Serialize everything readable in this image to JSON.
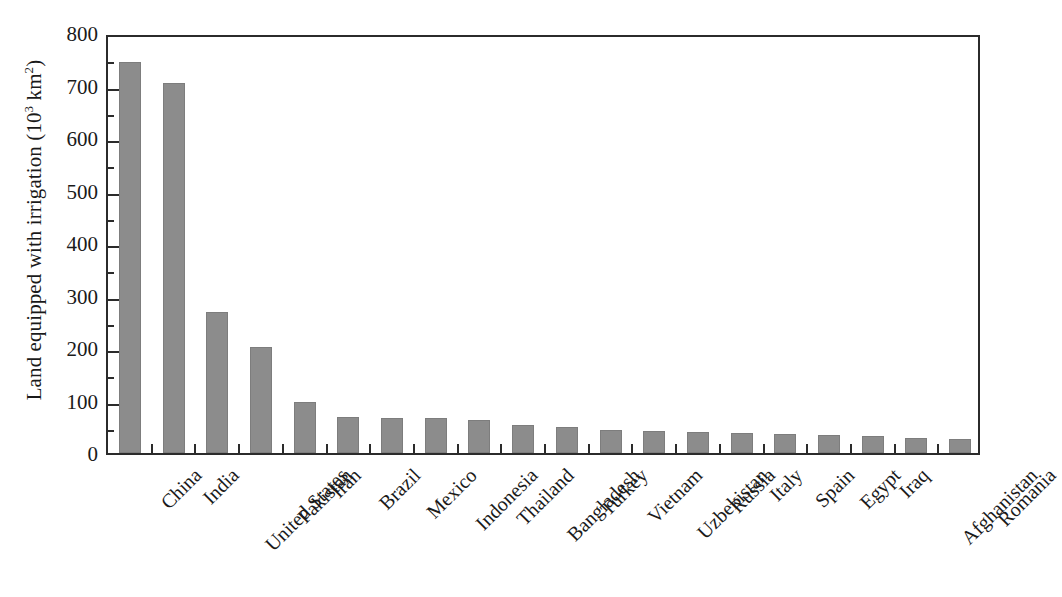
{
  "chart_data": {
    "type": "bar",
    "title": "",
    "xlabel": "",
    "ylabel": "Land equipped with irrigation (10³ km²)",
    "ylabel_prefix": "Land equipped with irrigation (10",
    "ylabel_sup1": "3",
    "ylabel_mid": " km",
    "ylabel_sup2": "2",
    "ylabel_suffix": ")",
    "ylim": [
      0,
      800
    ],
    "ytick_step": 100,
    "yminor_step": 50,
    "grid": false,
    "legend": null,
    "bar_color": "#8c8c8c",
    "axis_color": "#2b2b2b",
    "yticks": [
      "800",
      "700",
      "600",
      "500",
      "400",
      "300",
      "200",
      "100",
      "0"
    ],
    "categories": [
      "China",
      "India",
      "United States",
      "Pakistan",
      "Iran",
      "Brazil",
      "Mexico",
      "Indonesia",
      "Thailand",
      "Bangladesh",
      "Turkey",
      "Vietnam",
      "Uzbekistan",
      "Russia",
      "Italy",
      "Spain",
      "Egypt",
      "Iraq",
      "Afghanistan",
      "Romania"
    ],
    "values": [
      744,
      704,
      268,
      201,
      97,
      69,
      67,
      66,
      62,
      53,
      49,
      44,
      42,
      40,
      38,
      36,
      35,
      32,
      29,
      27
    ],
    "units": "10^3 km^2"
  }
}
